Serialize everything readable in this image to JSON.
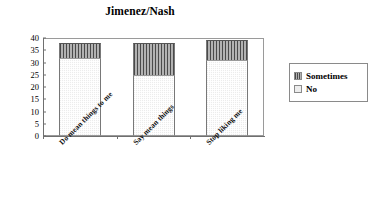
{
  "chart_data": {
    "type": "bar",
    "subtype": "stacked-column",
    "title": "Jimenez/Nash",
    "xlabel": "",
    "ylabel": "",
    "ylim": [
      0,
      40
    ],
    "ytick_labels": [
      "40",
      "35",
      "30",
      "25",
      "20",
      "15",
      "10",
      "5",
      "0"
    ],
    "ytick_values": [
      40,
      35,
      30,
      25,
      20,
      15,
      10,
      5,
      0
    ],
    "grid": false,
    "categories": [
      "Do mean things to me",
      "Say mean things",
      "Stop liking me"
    ],
    "series": [
      {
        "name": "No",
        "values": [
          32,
          25,
          31
        ]
      },
      {
        "name": "Sometimes",
        "values": [
          6,
          13,
          8
        ]
      }
    ],
    "totals": [
      38,
      38,
      39
    ],
    "legend": {
      "position": "right",
      "entries": [
        {
          "label": "Sometimes",
          "swatch": "dark-vertical-stripe"
        },
        {
          "label": "No",
          "swatch": "light-dotted"
        }
      ]
    }
  },
  "chart": {
    "title": "Jimenez/Nash"
  },
  "legend": {
    "items": [
      {
        "label": "Sometimes"
      },
      {
        "label": "No"
      }
    ]
  },
  "axis": {
    "y_ticks": [
      "40",
      "35",
      "30",
      "25",
      "20",
      "15",
      "10",
      "5",
      "0"
    ],
    "x_ticks": [
      "Do mean things to me",
      "Say mean things",
      "Stop liking me"
    ]
  }
}
